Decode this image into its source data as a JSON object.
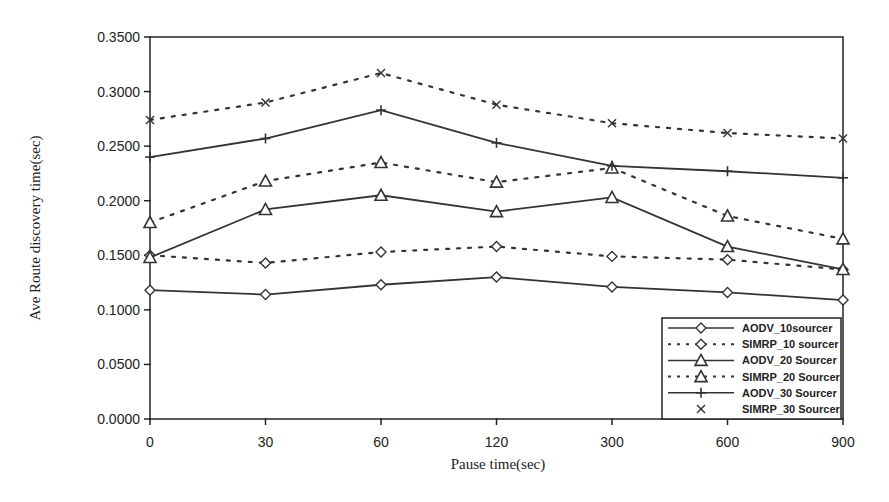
{
  "chart_data": {
    "type": "line",
    "title": "",
    "xlabel": "Pause time(sec)",
    "ylabel": "Ave Route discovery time(sec)",
    "categories": [
      "0",
      "30",
      "60",
      "120",
      "300",
      "600",
      "900"
    ],
    "ylim": [
      0,
      0.35
    ],
    "yticks": [
      "0.0000",
      "0.0500",
      "0.1000",
      "0.1500",
      "0.2000",
      "0.2500",
      "0.3000",
      "0.3500"
    ],
    "grid": false,
    "legend_position": "lower right, inside plot",
    "series": [
      {
        "name": "AODV_10sourcer",
        "marker": "diamond",
        "line": "solid",
        "values": [
          0.118,
          0.114,
          0.123,
          0.13,
          0.121,
          0.116,
          0.109
        ]
      },
      {
        "name": "SIMRP_10 sourcer",
        "marker": "diamond",
        "line": "dotted",
        "values": [
          0.15,
          0.143,
          0.153,
          0.158,
          0.149,
          0.146,
          0.137
        ]
      },
      {
        "name": "AODV_20 Sourcer",
        "marker": "triangle",
        "line": "solid",
        "values": [
          0.148,
          0.192,
          0.205,
          0.19,
          0.203,
          0.158,
          0.137
        ]
      },
      {
        "name": "SIMRP_20 Sourcer",
        "marker": "triangle",
        "line": "dotted",
        "values": [
          0.18,
          0.218,
          0.235,
          0.217,
          0.23,
          0.186,
          0.165
        ]
      },
      {
        "name": "AODV_30 Sourcer",
        "marker": "plus",
        "line": "solid",
        "values": [
          0.24,
          0.257,
          0.283,
          0.253,
          0.232,
          0.227,
          0.221
        ]
      },
      {
        "name": "SIMRP_30 Sourcer",
        "marker": "x",
        "line": "dotted",
        "values": [
          0.274,
          0.29,
          0.317,
          0.288,
          0.271,
          0.262,
          0.257
        ]
      }
    ]
  },
  "colors": {
    "line": "#333333",
    "axis": "#222222",
    "background": "#ffffff"
  }
}
